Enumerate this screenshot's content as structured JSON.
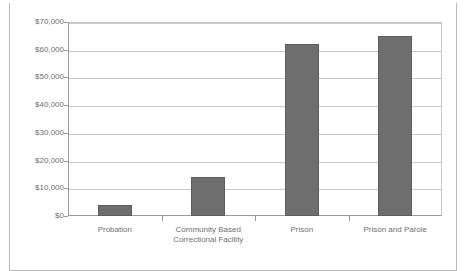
{
  "page": {
    "clipped_title_fragment": "annual cost per offender by sanction type"
  },
  "chart_data": {
    "type": "bar",
    "title": "",
    "xlabel": "",
    "ylabel": "",
    "categories": [
      "Probation",
      "Community Based Correctional Facility",
      "Prison",
      "Prison and Parole"
    ],
    "category_lines": [
      [
        "Probation"
      ],
      [
        "Community Based",
        "Correctional Facility"
      ],
      [
        "Prison"
      ],
      [
        "Prison and Parole"
      ]
    ],
    "values": [
      4000,
      14000,
      62200,
      65000
    ],
    "ylim": [
      0,
      70000
    ],
    "ytick_values": [
      0,
      10000,
      20000,
      30000,
      40000,
      50000,
      60000,
      70000
    ],
    "ytick_labels": [
      "$0",
      "$10,000",
      "$20,000",
      "$30,000",
      "$40,000",
      "$50,000",
      "$60,000",
      "$70,000"
    ],
    "grid": true,
    "legend": false,
    "colors": {
      "bar_fill": "#6e6e6e",
      "bar_outline": "#5d5d5d",
      "gridline": "#c8c8c8",
      "axis": "#9a9a9a",
      "text": "#6f6f6f",
      "background": "#ffffff",
      "page_border": "#b9b9b9"
    }
  }
}
